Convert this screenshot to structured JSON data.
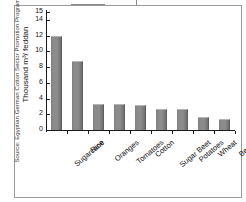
{
  "figure": {
    "partial_top_title": "",
    "source_note": "Source: Egyptian German Cotton Sector Promotion Program, 1997"
  },
  "chart_data": {
    "type": "bar",
    "title": "",
    "xlabel": "",
    "ylabel": "Thousand m³/ feddan",
    "ylim": [
      0,
      15
    ],
    "yticks": [
      0,
      2,
      4,
      6,
      8,
      10,
      12,
      14,
      15
    ],
    "ytick_labels": [
      "0",
      "2",
      "4",
      "6",
      "8",
      "10",
      "12",
      "14",
      "15"
    ],
    "grid": false,
    "legend": null,
    "bar_color": "#8a8a8a",
    "categories": [
      "Sugarcane",
      "Rice",
      "Oranges",
      "Tomatoes",
      "Cotton",
      "Sugar Beet",
      "Potatoes",
      "Wheat",
      "Beans"
    ],
    "values": [
      12.0,
      8.8,
      3.3,
      3.25,
      3.15,
      2.7,
      2.7,
      1.6,
      1.4
    ]
  }
}
